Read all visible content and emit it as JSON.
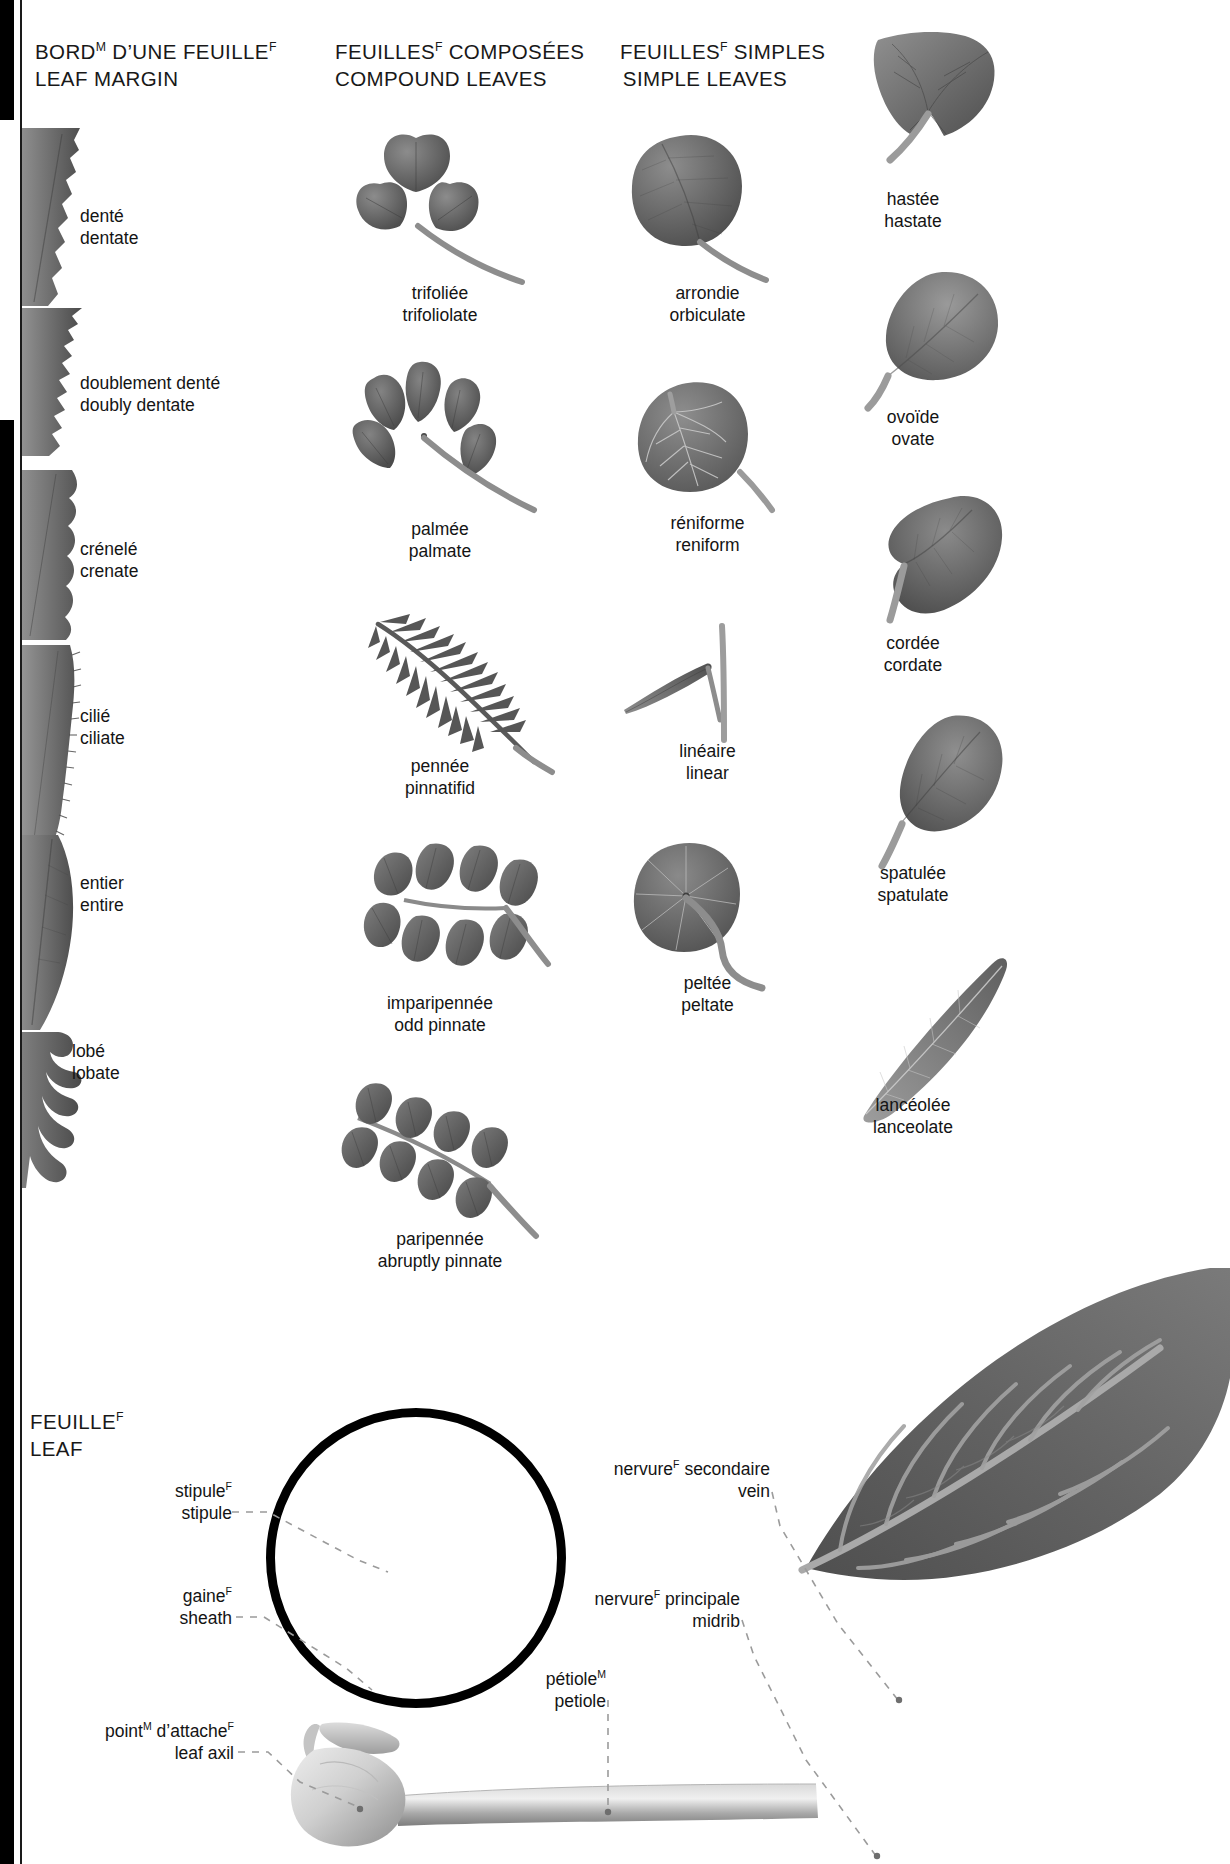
{
  "columns": {
    "leaf_margin": {
      "fr": "BORD",
      "fr_gender": "M",
      "fr_rest": " D’UNE FEUILLE",
      "fr_gender2": "F",
      "en": "LEAF MARGIN"
    },
    "compound": {
      "fr": "FEUILLES",
      "fr_gender": "F",
      "fr_rest": " COMPOSÉES",
      "en": "COMPOUND LEAVES"
    },
    "simple": {
      "fr": "FEUILLES",
      "fr_gender": "F",
      "fr_rest": " SIMPLES",
      "en": "SIMPLE LEAVES"
    },
    "leaf": {
      "fr": "FEUILLE",
      "fr_gender": "F",
      "en": "LEAF"
    }
  },
  "margins": [
    {
      "fr": "denté",
      "en": "dentate"
    },
    {
      "fr": "doublement denté",
      "en": "doubly dentate"
    },
    {
      "fr": "crénelé",
      "en": "crenate"
    },
    {
      "fr": "cilié",
      "en": "ciliate"
    },
    {
      "fr": "entier",
      "en": "entire"
    },
    {
      "fr": "lobé",
      "en": "lobate"
    }
  ],
  "compound_leaves": [
    {
      "fr": "trifoliée",
      "en": "trifoliolate"
    },
    {
      "fr": "palmée",
      "en": "palmate"
    },
    {
      "fr": "pennée",
      "en": "pinnatifid"
    },
    {
      "fr": "imparipennée",
      "en": "odd pinnate"
    },
    {
      "fr": "paripennée",
      "en": "abruptly pinnate"
    }
  ],
  "simple_leaves_inner": [
    {
      "fr": "arrondie",
      "en": "orbiculate"
    },
    {
      "fr": "réniforme",
      "en": "reniform"
    },
    {
      "fr": "linéaire",
      "en": "linear"
    },
    {
      "fr": "peltée",
      "en": "peltate"
    }
  ],
  "simple_leaves_outer": [
    {
      "fr": "hastée",
      "en": "hastate"
    },
    {
      "fr": "ovoïde",
      "en": "ovate"
    },
    {
      "fr": "cordée",
      "en": "cordate"
    },
    {
      "fr": "spatulée",
      "en": "spatulate"
    },
    {
      "fr": "lancéolée",
      "en": "lanceolate"
    }
  ],
  "anatomy": {
    "stipule": {
      "fr": "stipule",
      "fr_gender": "F",
      "en": "stipule"
    },
    "sheath": {
      "fr": "gaine",
      "fr_gender": "F",
      "en": "sheath"
    },
    "leaf_axil": {
      "fr": "point",
      "fr_gender": "M",
      "fr_rest": " d’attache",
      "fr_gender2": "F",
      "en": "leaf axil"
    },
    "petiole": {
      "fr": "pétiole",
      "fr_gender": "M",
      "en": "petiole"
    },
    "midrib": {
      "fr": "nervure",
      "fr_gender": "F",
      "fr_rest": " principale",
      "en": "midrib"
    },
    "vein": {
      "fr": "nervure",
      "fr_gender": "F",
      "fr_rest": " secondaire",
      "en": "vein"
    }
  },
  "colors": {
    "ink": "#1a1a1a",
    "leaf_dark": "#5d5d5d",
    "leaf_mid": "#6e6e6e",
    "leaf_light": "#9a9a9a",
    "leader": "#9b9b9b",
    "stem": "#8a8a8a"
  }
}
